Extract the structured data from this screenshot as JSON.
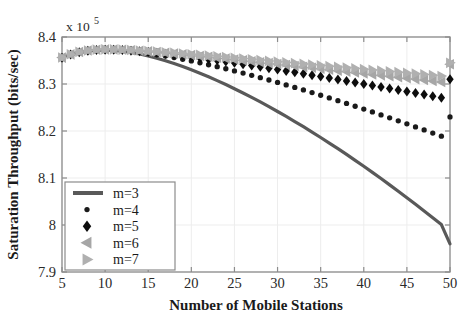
{
  "chart_data": {
    "type": "line",
    "title": "",
    "xlabel": "Number of Mobile Stations",
    "ylabel": "Saturation Throughput  (bits/sec)",
    "y_exponent_label": "x 10",
    "y_exponent_power": "5",
    "xlim": [
      5,
      50
    ],
    "ylim": [
      7.9,
      8.4
    ],
    "xticks": [
      "5",
      "10",
      "15",
      "20",
      "25",
      "30",
      "35",
      "40",
      "45",
      "50"
    ],
    "xtick_values": [
      5,
      10,
      15,
      20,
      25,
      30,
      35,
      40,
      45,
      50
    ],
    "yticks": [
      "7.9",
      "8",
      "8.1",
      "8.2",
      "8.3",
      "8.4"
    ],
    "ytick_values": [
      7.9,
      8.0,
      8.1,
      8.2,
      8.3,
      8.4
    ],
    "grid": true,
    "legend_position": "lower-left",
    "y_scale_note": "values in units of 1e5",
    "series": [
      {
        "name": "m=3",
        "legend_label": "m=3",
        "style": "line",
        "color": "#595959",
        "marker": "none",
        "x": [
          5,
          6,
          7,
          8,
          9,
          10,
          11,
          12,
          13,
          14,
          15,
          16,
          17,
          18,
          19,
          20,
          21,
          22,
          23,
          24,
          25,
          26,
          27,
          28,
          29,
          30,
          31,
          32,
          33,
          34,
          35,
          36,
          37,
          38,
          39,
          40,
          41,
          42,
          43,
          44,
          45,
          46,
          47,
          48,
          49,
          50
        ],
        "values": [
          8.3555,
          8.362,
          8.3668,
          8.37,
          8.3718,
          8.3722,
          8.3715,
          8.3698,
          8.3672,
          8.3638,
          8.3597,
          8.3549,
          8.3495,
          8.3436,
          8.3372,
          8.3303,
          8.323,
          8.3153,
          8.3072,
          8.2988,
          8.29,
          8.2809,
          8.2715,
          8.2618,
          8.2518,
          8.2415,
          8.231,
          8.2202,
          8.2091,
          8.1978,
          8.1862,
          8.1744,
          8.1624,
          8.1501,
          8.1376,
          8.1249,
          8.112,
          8.0988,
          8.0854,
          8.0718,
          8.058,
          8.044,
          8.0298,
          8.0154,
          8.0008,
          7.96
        ]
      },
      {
        "name": "m=4",
        "legend_label": "m=4",
        "style": "markers",
        "color": "#1a1a1a",
        "marker": "circle",
        "x": [
          5,
          6,
          7,
          8,
          9,
          10,
          11,
          12,
          13,
          14,
          15,
          16,
          17,
          18,
          19,
          20,
          21,
          22,
          23,
          24,
          25,
          26,
          27,
          28,
          29,
          30,
          31,
          32,
          33,
          34,
          35,
          36,
          37,
          38,
          39,
          40,
          41,
          42,
          43,
          44,
          45,
          46,
          47,
          48,
          49,
          50
        ],
        "values": [
          8.3558,
          8.3625,
          8.3675,
          8.3705,
          8.3722,
          8.3726,
          8.3722,
          8.3712,
          8.3696,
          8.3676,
          8.3652,
          8.3625,
          8.3595,
          8.3562,
          8.3527,
          8.349,
          8.3451,
          8.341,
          8.3368,
          8.3324,
          8.3279,
          8.3232,
          8.3184,
          8.3135,
          8.3085,
          8.3034,
          8.2981,
          8.2928,
          8.2873,
          8.2818,
          8.2761,
          8.2704,
          8.2646,
          8.2587,
          8.2527,
          8.2466,
          8.2405,
          8.2343,
          8.228,
          8.2216,
          8.2152,
          8.2087,
          8.2022,
          8.1956,
          8.1889,
          8.23
        ]
      },
      {
        "name": "m=5",
        "legend_label": "m=5",
        "style": "markers",
        "color": "#0d0d0d",
        "marker": "diamond",
        "x": [
          5,
          6,
          7,
          8,
          9,
          10,
          11,
          12,
          13,
          14,
          15,
          16,
          17,
          18,
          19,
          20,
          21,
          22,
          23,
          24,
          25,
          26,
          27,
          28,
          29,
          30,
          31,
          32,
          33,
          34,
          35,
          36,
          37,
          38,
          39,
          40,
          41,
          42,
          43,
          44,
          45,
          46,
          47,
          48,
          49,
          50
        ],
        "values": [
          8.356,
          8.3628,
          8.3678,
          8.3708,
          8.3725,
          8.373,
          8.3728,
          8.3721,
          8.371,
          8.3697,
          8.3681,
          8.3663,
          8.3644,
          8.3623,
          8.3601,
          8.3578,
          8.3554,
          8.3529,
          8.3503,
          8.3477,
          8.345,
          8.3422,
          8.3394,
          8.3366,
          8.3337,
          8.3308,
          8.3278,
          8.3248,
          8.3218,
          8.3187,
          8.3157,
          8.3126,
          8.3095,
          8.3063,
          8.3032,
          8.3,
          8.2968,
          8.2936,
          8.2904,
          8.2872,
          8.284,
          8.2807,
          8.2775,
          8.2742,
          8.271,
          8.31
        ]
      },
      {
        "name": "m=6",
        "legend_label": "m=6",
        "style": "markers",
        "color": "#a6a6a6",
        "marker": "triangle-left",
        "x": [
          5,
          6,
          7,
          8,
          9,
          10,
          11,
          12,
          13,
          14,
          15,
          16,
          17,
          18,
          19,
          20,
          21,
          22,
          23,
          24,
          25,
          26,
          27,
          28,
          29,
          30,
          31,
          32,
          33,
          34,
          35,
          36,
          37,
          38,
          39,
          40,
          41,
          42,
          43,
          44,
          45,
          46,
          47,
          48,
          49,
          50
        ],
        "values": [
          8.3562,
          8.363,
          8.3681,
          8.3711,
          8.3728,
          8.3734,
          8.3733,
          8.3727,
          8.3718,
          8.3707,
          8.3694,
          8.368,
          8.3665,
          8.3649,
          8.3632,
          8.3615,
          8.3597,
          8.3579,
          8.356,
          8.3541,
          8.3522,
          8.3503,
          8.3483,
          8.3464,
          8.3444,
          8.3424,
          8.3404,
          8.3384,
          8.3364,
          8.3344,
          8.3324,
          8.3304,
          8.3284,
          8.3264,
          8.3244,
          8.3224,
          8.3204,
          8.3184,
          8.3164,
          8.3144,
          8.3124,
          8.3104,
          8.3084,
          8.3064,
          8.3044,
          8.342
        ]
      },
      {
        "name": "m=7",
        "legend_label": "m=7",
        "style": "markers",
        "color": "#b0b0b0",
        "marker": "triangle-right",
        "x": [
          5,
          6,
          7,
          8,
          9,
          10,
          11,
          12,
          13,
          14,
          15,
          16,
          17,
          18,
          19,
          20,
          21,
          22,
          23,
          24,
          25,
          26,
          27,
          28,
          29,
          30,
          31,
          32,
          33,
          34,
          35,
          36,
          37,
          38,
          39,
          40,
          41,
          42,
          43,
          44,
          45,
          46,
          47,
          48,
          49,
          50
        ],
        "values": [
          8.3564,
          8.3632,
          8.3683,
          8.3713,
          8.3731,
          8.3737,
          8.3736,
          8.3731,
          8.3723,
          8.3713,
          8.3702,
          8.369,
          8.3677,
          8.3663,
          8.3649,
          8.3634,
          8.3619,
          8.3604,
          8.3588,
          8.3572,
          8.3556,
          8.354,
          8.3524,
          8.3508,
          8.3492,
          8.3476,
          8.346,
          8.3444,
          8.3428,
          8.3412,
          8.3396,
          8.338,
          8.3364,
          8.3348,
          8.3332,
          8.3316,
          8.33,
          8.3284,
          8.3268,
          8.3252,
          8.3236,
          8.322,
          8.3204,
          8.3188,
          8.3172,
          8.345
        ]
      }
    ]
  },
  "figure": {
    "background_color": "#ffffff",
    "axis_color": "#8c8c8c",
    "grid_color": "#ededed",
    "text_color": "#1a1a1a"
  }
}
